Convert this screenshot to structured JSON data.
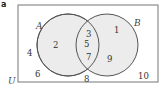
{
  "figure": {
    "part_label": "a",
    "universal_label": "U",
    "sets": [
      {
        "name": "A",
        "color_fill": "#ececec",
        "stroke": "#555555"
      },
      {
        "name": "B",
        "color_fill": "#ececec",
        "stroke": "#555555"
      }
    ],
    "regions": {
      "A_only": [
        "2"
      ],
      "A_and_B": [
        "3",
        "5",
        "7"
      ],
      "B_only": [
        "1",
        "9"
      ],
      "outside": [
        "4",
        "6",
        "8",
        "10"
      ]
    },
    "numbers": {
      "n1": "1",
      "n2": "2",
      "n3": "3",
      "n4": "4",
      "n5": "5",
      "n6": "6",
      "n7": "7",
      "n8": "8",
      "n9": "9",
      "n10": "10"
    }
  }
}
